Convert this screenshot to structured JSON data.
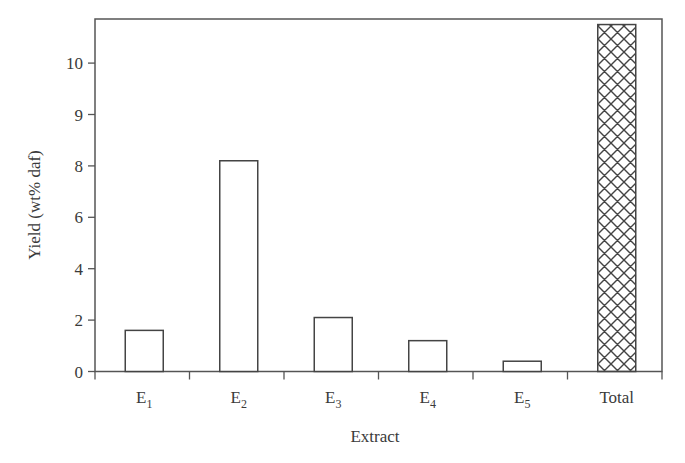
{
  "chart_data": {
    "type": "bar",
    "title": "",
    "xlabel": "Extract",
    "ylabel": "Yield (wt% daf)",
    "categories": [
      "E1",
      "E2",
      "E3",
      "E4",
      "E5",
      "Total"
    ],
    "category_labels": [
      {
        "base": "E",
        "sub": "1"
      },
      {
        "base": "E",
        "sub": "2"
      },
      {
        "base": "E",
        "sub": "3"
      },
      {
        "base": "E",
        "sub": "4"
      },
      {
        "base": "E",
        "sub": "5"
      },
      {
        "base": "Total",
        "sub": ""
      }
    ],
    "values": [
      1.6,
      8.2,
      2.1,
      1.2,
      0.4,
      13.5
    ],
    "bar_styles": [
      "open",
      "open",
      "open",
      "open",
      "open",
      "crosshatch"
    ],
    "yticks": [
      "0",
      "2",
      "4",
      "6",
      "8",
      "9",
      "10"
    ],
    "ylim": [
      0,
      13.7
    ],
    "grid": false,
    "legend": null
  },
  "colors": {
    "axis": "#555555",
    "bar_edge": "#444444",
    "bar_fill": "#ffffff",
    "hatch": "#444444",
    "text": "#3a3a3a"
  }
}
